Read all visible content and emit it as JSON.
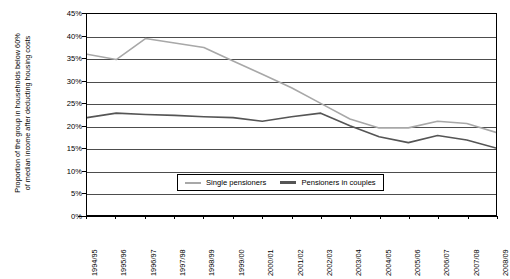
{
  "chart_data": {
    "type": "line",
    "title": "",
    "xlabel": "",
    "ylabel": "Proportion of the group in households below 60% of median income after deducting housing costs",
    "ylim": [
      0,
      45
    ],
    "ytick_labels": [
      "0%",
      "5%",
      "10%",
      "15%",
      "20%",
      "25%",
      "30%",
      "35%",
      "40%",
      "45%"
    ],
    "ytick_values": [
      0,
      5,
      10,
      15,
      20,
      25,
      30,
      35,
      40,
      45
    ],
    "grid": true,
    "legend_position": "bottom-center",
    "categories": [
      "1994/95",
      "1995/96",
      "1996/97",
      "1997/98",
      "1998/99",
      "1999/00",
      "2000/01",
      "2001/02",
      "2002/03",
      "2003/04",
      "2004/05",
      "2005/06",
      "2006/07",
      "2007/08",
      "2008/09"
    ],
    "series": [
      {
        "name": "Single pensioners",
        "color": "#a8a8a8",
        "values": [
          36.0,
          34.8,
          39.5,
          38.5,
          37.5,
          34.5,
          31.5,
          28.5,
          25.0,
          21.5,
          19.5,
          19.5,
          21.0,
          20.5,
          18.5
        ]
      },
      {
        "name": "Pensioners in couples",
        "color": "#555555",
        "values": [
          21.8,
          22.8,
          22.5,
          22.3,
          22.0,
          21.8,
          21.0,
          22.0,
          22.8,
          20.0,
          17.5,
          16.2,
          17.8,
          16.8,
          15.0
        ]
      }
    ]
  },
  "axis": {
    "y_title": "Proportion of the group in households below 60%\nof median income after deducting housing costs"
  },
  "legend": {
    "items": [
      {
        "label": "Single pensioners",
        "color": "#a8a8a8"
      },
      {
        "label": "Pensioners in couples",
        "color": "#555555"
      }
    ]
  }
}
